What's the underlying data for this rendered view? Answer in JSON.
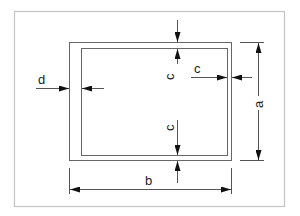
{
  "diagram": {
    "title": "",
    "colors": {
      "frame": "#bdbdbd",
      "line": "#555555",
      "arrow": "#111111",
      "text": "#222222"
    },
    "labels": {
      "d": "d",
      "c_top": "c",
      "c_right": "c",
      "c_bottom": "c",
      "a": "a",
      "b": "b"
    },
    "dimensions": [
      {
        "name": "d",
        "description": "wall thickness, left side"
      },
      {
        "name": "c",
        "description": "wall thickness, top"
      },
      {
        "name": "c",
        "description": "wall thickness, right side"
      },
      {
        "name": "c",
        "description": "wall thickness, bottom"
      },
      {
        "name": "a",
        "description": "outer height"
      },
      {
        "name": "b",
        "description": "outer width"
      }
    ]
  }
}
